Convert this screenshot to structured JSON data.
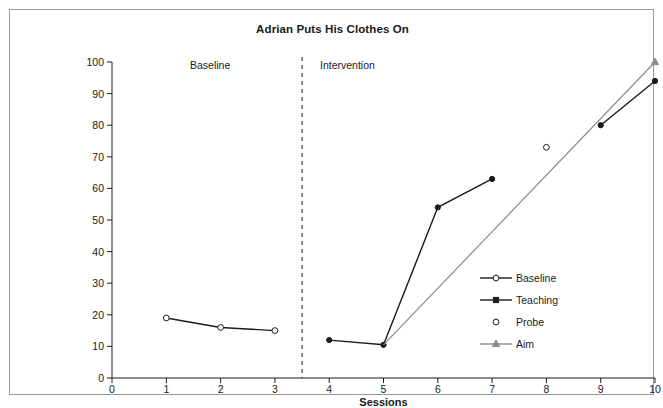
{
  "figure": {
    "title": "Adrian Puts His Clothes On",
    "border_color": "#9a9a9a",
    "background": "#ffffff"
  },
  "axes": {
    "x_title": "Sessions",
    "y_title": "Average Percent of Steps Performed Independently",
    "x_ticks": [
      "0",
      "1",
      "2",
      "3",
      "4",
      "5",
      "6",
      "7",
      "8",
      "9",
      "10"
    ],
    "y_ticks": [
      "0",
      "10",
      "20",
      "30",
      "40",
      "50",
      "60",
      "70",
      "80",
      "90",
      "100"
    ]
  },
  "phases": {
    "baseline_label": "Baseline",
    "intervention_label": "Intervention",
    "divider_x": 3.5
  },
  "legend": {
    "items": [
      {
        "label": "Baseline",
        "marker": "open-circle",
        "line": true,
        "color": "#1a1a1a"
      },
      {
        "label": "Teaching",
        "marker": "filled-square",
        "line": true,
        "color": "#1a1a1a"
      },
      {
        "label": "Probe",
        "marker": "open-circle",
        "line": false,
        "color": "#1a1a1a"
      },
      {
        "label": "Aim",
        "marker": "filled-triangle",
        "line": true,
        "color": "#8a8a8a"
      }
    ]
  },
  "chart_data": {
    "type": "line",
    "title": "Adrian Puts His Clothes On",
    "xlabel": "Sessions",
    "ylabel": "Average Percent of Steps Performed Independently",
    "xlim": [
      0,
      10
    ],
    "ylim": [
      0,
      100
    ],
    "xticks": [
      0,
      1,
      2,
      3,
      4,
      5,
      6,
      7,
      8,
      9,
      10
    ],
    "yticks": [
      0,
      10,
      20,
      30,
      40,
      50,
      60,
      70,
      80,
      90,
      100
    ],
    "grid": false,
    "legend_position": "center-right",
    "annotations": [
      {
        "text": "Baseline",
        "x": 1.75,
        "y": 100
      },
      {
        "text": "Intervention",
        "x": 5.5,
        "y": 100
      }
    ],
    "phase_lines": [
      {
        "x": 3.5,
        "style": "dashed"
      }
    ],
    "series": [
      {
        "name": "Baseline",
        "marker": "open-circle",
        "color": "#1a1a1a",
        "x": [
          1,
          2,
          3
        ],
        "values": [
          19,
          16,
          15
        ]
      },
      {
        "name": "Teaching",
        "marker": "filled-circle",
        "color": "#1a1a1a",
        "x": [
          4,
          5,
          6,
          7
        ],
        "values": [
          12,
          10.5,
          54,
          63
        ]
      },
      {
        "name": "Teaching",
        "marker": "filled-circle",
        "color": "#1a1a1a",
        "x": [
          9,
          10
        ],
        "values": [
          80,
          94
        ]
      },
      {
        "name": "Probe",
        "marker": "open-circle",
        "color": "#1a1a1a",
        "x": [
          8
        ],
        "values": [
          73
        ]
      },
      {
        "name": "Aim",
        "marker": "filled-triangle",
        "color": "#8a8a8a",
        "x": [
          5,
          10
        ],
        "values": [
          10.5,
          100
        ]
      }
    ]
  }
}
